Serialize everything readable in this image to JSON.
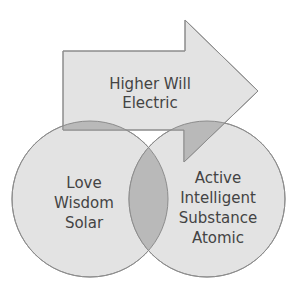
{
  "diagram": {
    "arrow": {
      "lines": [
        "Higher Will",
        "Electric"
      ]
    },
    "left_circle": {
      "lines": [
        "Love",
        "Wisdom",
        "Solar"
      ]
    },
    "right_circle": {
      "lines": [
        "Active",
        "Intelligent",
        "Substance",
        "Atomic"
      ]
    },
    "colors": {
      "fill": "#e3e3e3",
      "overlap": "#b9b9b9",
      "stroke": "#8c8c8c",
      "text": "#444444"
    }
  }
}
